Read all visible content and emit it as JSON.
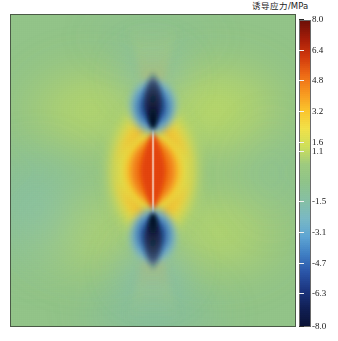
{
  "figure": {
    "background_color": "#ffffff",
    "plot_border_color": "#4a5a46"
  },
  "colorbar": {
    "title": "诱导应力/MPa",
    "title_icon": "colorbar-title-label",
    "orientation": "vertical",
    "vmin": -8.0,
    "vmax": 8.0,
    "tick_labels": [
      "8.0",
      "6.4",
      "4.8",
      "3.2",
      "1.6",
      "1.1",
      "-1.5",
      "-3.1",
      "-4.7",
      "-6.3",
      "-8.0"
    ],
    "tick_values": [
      8.0,
      6.4,
      4.8,
      3.2,
      1.6,
      1.1,
      -1.5,
      -3.1,
      -4.7,
      -6.3,
      -8.0
    ],
    "colors": [
      "#6d0f07",
      "#a51c08",
      "#d2380b",
      "#ee6a15",
      "#f8971f",
      "#fbc52c",
      "#f2e249",
      "#cfe05a",
      "#9ecb7f",
      "#8fc48a",
      "#86c0a4",
      "#7ab9c4",
      "#5fa6d4",
      "#3f7fc4",
      "#2a55a8",
      "#1b3580",
      "#101f55",
      "#0a1236"
    ]
  },
  "chart_data": {
    "type": "heatmap",
    "title": "诱导应力/MPa",
    "xlabel": "",
    "ylabel": "",
    "colorbar_label": "诱导应力/MPa",
    "colormap": "jet-like (dark red high, navy low)",
    "grid": false,
    "legend_position": "right",
    "zlim": [
      -8.0,
      8.0
    ],
    "tick_labels": [
      "8.0",
      "6.4",
      "4.8",
      "3.2",
      "1.6",
      "1.1",
      "-1.5",
      "-3.1",
      "-4.7",
      "-6.3",
      "-8.0"
    ],
    "background_value": 0.6,
    "background_color": "#93c589",
    "features": [
      {
        "name": "vertical-fracture",
        "geometry": "vertical line segment at x=0.5, from y=0.37 to y=0.73 (normalized)",
        "description": "open crack trace rendered as thin light line"
      },
      {
        "name": "tensile-lobe",
        "geometry": "lenticular region hugging the crack",
        "peak_value": 8.0,
        "color": "#ee6a15",
        "description": "high induced tensile stress along crack faces, red-orange"
      },
      {
        "name": "compressive-lobe-top",
        "geometry": "teardrop above upper crack tip, centered x=0.5 y=0.31",
        "peak_value": -8.0,
        "color": "#0a1236",
        "description": "strong compression concentration at upper crack tip"
      },
      {
        "name": "compressive-lobe-bottom",
        "geometry": "teardrop below lower crack tip, centered x=0.5 y=0.77",
        "peak_value": -8.0,
        "color": "#0a1236",
        "description": "strong compression concentration at lower crack tip"
      },
      {
        "name": "far-field-quadrant-lobes",
        "geometry": "four diagonal lobes radiating from crack tips",
        "peak_value": 2.4,
        "color": "#cfe05a",
        "description": "mild tension wings, yellow-green"
      },
      {
        "name": "far-field",
        "geometry": "domain remainder",
        "peak_value": 0.6,
        "color": "#93c589",
        "description": "near-zero background induced stress"
      }
    ]
  }
}
